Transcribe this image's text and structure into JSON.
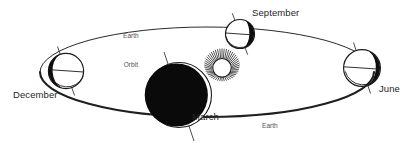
{
  "diagram": {
    "background_color": "#ffffff",
    "ink_color": "#1a1a1a",
    "label_color": "#262626",
    "orbit_label_color": "#555555",
    "sun": {
      "name": "sun",
      "center": [
        222,
        68
      ],
      "core_radius": 9.5,
      "ray_count": 44,
      "core_fill": "#ffffff"
    },
    "orbit": {
      "center": [
        207,
        72
      ],
      "rx": 167,
      "ry": 45,
      "back_stroke_width": 1.0,
      "front_stroke_width": 2.2,
      "label_text_line1": "Earth",
      "label_text_line2": "Orbit"
    },
    "earth_positions": [
      {
        "name": "december",
        "label": "December",
        "center": [
          66,
          71
        ],
        "radius": 18,
        "shadow_side": "left",
        "shadow_type": "half",
        "axis_tilt_deg": 23.5,
        "axis_length": 27
      },
      {
        "name": "march",
        "label": "March",
        "center": [
          179,
          95
        ],
        "radius": 33,
        "shadow_side": "full",
        "shadow_type": "full",
        "axis_tilt_deg": 23.5,
        "axis_length": 47
      },
      {
        "name": "september",
        "label": "September",
        "center": [
          240,
          34
        ],
        "radius": 15,
        "shadow_side": "right",
        "shadow_type": "crescent",
        "axis_tilt_deg": 23.5,
        "axis_length": 23
      },
      {
        "name": "june",
        "label": "June",
        "center": [
          362,
          68
        ],
        "radius": 19,
        "shadow_side": "right",
        "shadow_type": "half",
        "axis_tilt_deg": 23.5,
        "axis_length": 28
      }
    ],
    "labels": {
      "december": "December",
      "march": "March",
      "september": "September",
      "june": "June",
      "earth_orbit_top_line1": "Earth",
      "earth_orbit_top_line2": "Orbit",
      "earth_orbit_bottom_line1": "Earth",
      "earth_orbit_bottom_line2": "Orbit"
    }
  }
}
